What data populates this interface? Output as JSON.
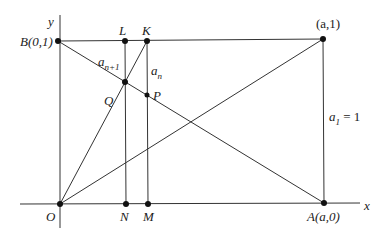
{
  "axes": {
    "x_label": "x",
    "y_label": "y"
  },
  "points": {
    "O": {
      "label": "O"
    },
    "N": {
      "label": "N"
    },
    "M": {
      "label": "M"
    },
    "A": {
      "label": "A(a,0)"
    },
    "B": {
      "label": "B(0,1)"
    },
    "L": {
      "label": "L"
    },
    "K": {
      "label": "K"
    },
    "Q": {
      "label": "Q"
    },
    "P": {
      "label": "P"
    },
    "C": {
      "label": "(a,1)"
    }
  },
  "segments": {
    "a_n_plus_1": {
      "base": "a",
      "sub": "n+1"
    },
    "a_n": {
      "base": "a",
      "sub": "n"
    },
    "a_1": {
      "base": "a",
      "sub": "1",
      "suffix": " = 1"
    }
  }
}
